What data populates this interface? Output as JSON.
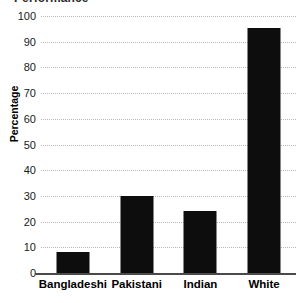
{
  "chart_data": {
    "type": "bar",
    "title": "Performance",
    "title_clipped": true,
    "xlabel": "",
    "ylabel": "Percentage",
    "categories": [
      "Bangladeshi",
      "Pakistani",
      "Indian",
      "White"
    ],
    "values": [
      8,
      30,
      24,
      95.5
    ],
    "ylim": [
      0,
      100
    ],
    "ytick_labels": [
      "0",
      "10",
      "20",
      "30",
      "40",
      "50",
      "60",
      "70",
      "80",
      "90",
      "100"
    ],
    "ytick_values": [
      0,
      10,
      20,
      30,
      40,
      50,
      60,
      70,
      80,
      90,
      100
    ],
    "grid": "horizontal-dotted",
    "legend": "none",
    "bar_color": "#0d0d0d",
    "grid_color": "#b9b9b9",
    "axis_color": "#4a4a4a",
    "background": "#ffffff"
  }
}
